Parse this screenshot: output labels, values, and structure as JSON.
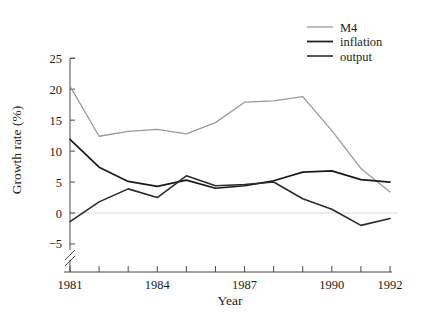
{
  "chart_data": {
    "type": "line",
    "title": "",
    "xlabel": "Year",
    "ylabel": "Growth rate (%)",
    "xlim": [
      1981,
      1992
    ],
    "ylim": [
      -6,
      25
    ],
    "grid": false,
    "legend_position": "top-right",
    "axis_break": true,
    "x": [
      1981,
      1982,
      1983,
      1984,
      1985,
      1986,
      1987,
      1988,
      1989,
      1990,
      1991,
      1992
    ],
    "xticks_major": [
      1981,
      1984,
      1987,
      1990,
      1992
    ],
    "xtick_labels": [
      "1981",
      "1984",
      "1987",
      "1990",
      "1992"
    ],
    "yticks": [
      -5,
      0,
      5,
      10,
      15,
      20,
      25
    ],
    "ytick_labels": [
      "−5",
      "0",
      "5",
      "10",
      "15",
      "20",
      "25"
    ],
    "series": [
      {
        "name": "M4",
        "color": "#9a9a9a",
        "width": 1.3,
        "values": [
          20.5,
          12.4,
          13.2,
          13.5,
          12.8,
          14.6,
          17.9,
          18.1,
          18.8,
          13.3,
          7.2,
          3.4
        ]
      },
      {
        "name": "inflation",
        "color": "#1a1a1a",
        "width": 1.7,
        "values": [
          11.9,
          7.4,
          5.1,
          4.3,
          5.3,
          4.0,
          4.4,
          5.2,
          6.6,
          6.8,
          5.4,
          5.0
        ]
      },
      {
        "name": "output",
        "color": "#2b2b2b",
        "width": 1.6,
        "values": [
          -1.4,
          1.8,
          3.9,
          2.5,
          6.0,
          4.4,
          4.6,
          5.0,
          2.3,
          0.6,
          -2.0,
          -0.9
        ]
      }
    ]
  },
  "legend": {
    "entries": [
      {
        "label": "M4"
      },
      {
        "label": "inflation"
      },
      {
        "label": "output"
      }
    ]
  },
  "axes": {
    "x_title": "Year",
    "y_title": "Growth rate (%)"
  }
}
